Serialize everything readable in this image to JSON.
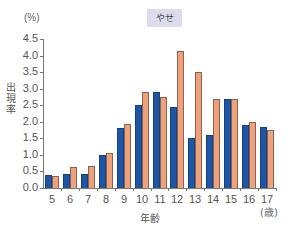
{
  "badge": "やせ",
  "unit_label": "(%)",
  "ylabel": "出現率",
  "xlabel": "年齢",
  "xunit": "(歳)",
  "colors": {
    "series1": "#1e55a5",
    "series2": "#eda27c"
  },
  "chart_data": {
    "type": "bar",
    "title": "やせ",
    "xlabel": "年齢 (歳)",
    "ylabel": "出現率 (%)",
    "ylim": [
      0,
      4.5
    ],
    "yticks": [
      "0.0",
      "0.5",
      "1.0",
      "1.5",
      "2.0",
      "2.5",
      "3.0",
      "3.5",
      "4.0",
      "4.5"
    ],
    "grid": false,
    "legend": "none",
    "categories": [
      "5",
      "6",
      "7",
      "8",
      "9",
      "10",
      "11",
      "12",
      "13",
      "14",
      "15",
      "16",
      "17"
    ],
    "series": [
      {
        "name": "series-blue",
        "color": "#1e55a5",
        "values": [
          0.38,
          0.42,
          0.42,
          1.0,
          1.8,
          2.5,
          2.9,
          2.45,
          1.5,
          1.6,
          2.7,
          1.9,
          1.85
        ]
      },
      {
        "name": "series-orange",
        "color": "#eda27c",
        "values": [
          0.35,
          0.63,
          0.67,
          1.07,
          1.92,
          2.9,
          2.75,
          4.15,
          3.5,
          2.7,
          2.7,
          2.0,
          1.75
        ]
      }
    ]
  }
}
